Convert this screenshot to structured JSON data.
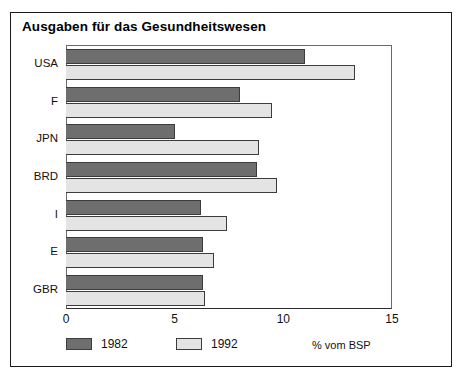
{
  "chart_data": {
    "type": "bar",
    "orientation": "horizontal",
    "title": "Ausgaben für das Gesundheitswesen",
    "xlabel": "% vom BSP",
    "ylabel": "",
    "categories": [
      "USA",
      "F",
      "JPN",
      "BRD",
      "I",
      "E",
      "GBR"
    ],
    "series": [
      {
        "name": "1982",
        "color": "#6e6e6e",
        "values": [
          11.0,
          8.0,
          5.0,
          8.8,
          6.2,
          6.3,
          6.3
        ]
      },
      {
        "name": "1992",
        "color": "#e4e4e4",
        "values": [
          13.3,
          9.5,
          8.9,
          9.7,
          7.4,
          6.8,
          6.4
        ]
      }
    ],
    "xlim": [
      0,
      15
    ],
    "xticks": [
      "0",
      "5",
      "10",
      "15"
    ],
    "xtick_values": [
      0,
      5,
      10,
      15
    ],
    "grid": false,
    "legend_position": "bottom-left"
  },
  "legend": {
    "items": [
      {
        "label": "1982"
      },
      {
        "label": "1992"
      }
    ],
    "unit_label": "% vom BSP"
  }
}
